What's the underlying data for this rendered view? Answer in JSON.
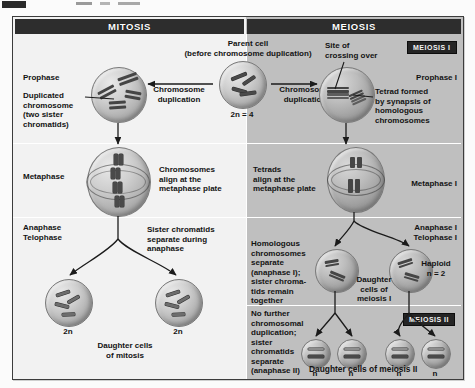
{
  "figure": {
    "columns": {
      "mitosis_header": "MITOSIS",
      "meiosis_header": "MEIOSIS"
    },
    "badges": {
      "meiosis_i": "MEIOSIS I",
      "meiosis_ii": "MEIOSIS II"
    },
    "parent_cell": {
      "title": "Parent cell",
      "subtitle": "(before chromosome duplication)",
      "ploidy": "2n = 4",
      "dup_left": "Chromosome\nduplication",
      "dup_right": "Chromosome\nduplication"
    },
    "rows": {
      "prophase": {
        "mitosis_stage": "Prophase",
        "mitosis_callout": "Duplicated\nchromosome\n(two sister\nchromatids)",
        "meiosis_stage": "Prophase I",
        "meiosis_callout_top": "Site of\ncrossing over",
        "meiosis_callout_right": "Tetrad formed\nby synapsis of\nhomologous\nchromosomes"
      },
      "metaphase": {
        "mitosis_stage": "Metaphase",
        "mitosis_callout": "Chromosomes\nalign at the\nmetaphase plate",
        "meiosis_stage": "Metaphase I",
        "meiosis_callout": "Tetrads\nalign at the\nmetaphase plate"
      },
      "anaphase": {
        "mitosis_stage": "Anaphase\nTelophase",
        "mitosis_callout": "Sister chromatids\nseparate during\nanaphase",
        "mitosis_cell_labels": [
          "2n",
          "2n"
        ],
        "mitosis_result": "Daughter cells\nof mitosis",
        "meiosis_stage": "Anaphase I\nTelophase I",
        "meiosis_callout": "Homologous\nchromosomes\nseparate\n(anaphase I);\nsister chroma-\ntids remain\ntogether",
        "meiosis_cell_labels": [
          "",
          ""
        ],
        "meiosis_result": "Daughter\ncells of\nmeiosis I",
        "haploid": "Haploid\nn = 2"
      },
      "meiosis_ii": {
        "callout": "No further\nchromosomal\nduplication;\nsister\nchromatids\nseparate\n(anaphase II)",
        "cell_labels": [
          "n",
          "n",
          "n",
          "n"
        ],
        "result": "Daughter cells of meiosis II"
      }
    }
  }
}
